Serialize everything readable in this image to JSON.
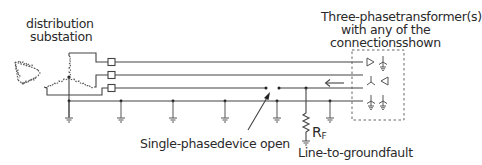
{
  "diagram": {
    "labels": {
      "substation_line1": "distribution",
      "substation_line2": "substation",
      "transformer_line1": "Three-phasetransformer(s)",
      "transformer_line2": "with any of the",
      "transformer_line3": "connectionsshown",
      "open_device": "Single-phasedevice open",
      "fault": "Line-to-groundfault",
      "resistor": "R",
      "resistor_sub": "F"
    },
    "components": {
      "source_primary": "delta-winding",
      "source_secondary": "grounded-wye-winding",
      "phase_devices": 3,
      "neutral_grounds": 5,
      "transformer_connections": [
        "delta",
        "grounded-wye",
        "wye",
        "delta",
        "grounded-wye",
        "grounded-wye"
      ]
    },
    "colors": {
      "line": "#444444",
      "text": "#2a2a2a",
      "background": "#ffffff"
    }
  }
}
